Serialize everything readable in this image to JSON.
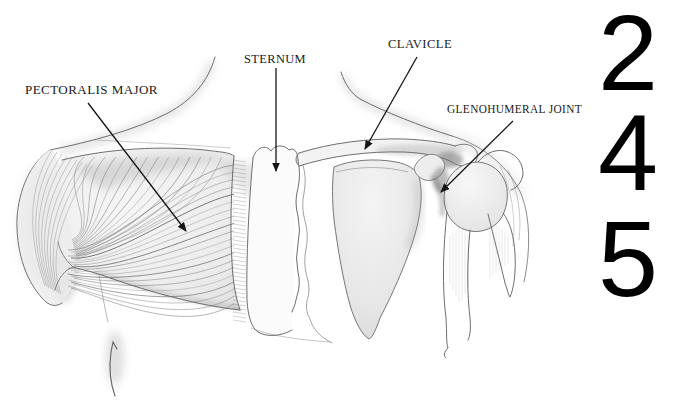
{
  "figure": {
    "type": "anatomical-diagram",
    "annotations": [
      {
        "text": "PECTORALIS MAJOR"
      },
      {
        "text": "STERNUM"
      },
      {
        "text": "CLAVICLE"
      },
      {
        "text": "GLENOHUMERAL JOINT"
      }
    ],
    "numbers": [
      "2",
      "4",
      "5"
    ],
    "colors": {
      "ink": "#1a1a1a",
      "sketch_gray": "#6e6e6e",
      "number_black": "#000000",
      "background": "#ffffff"
    }
  }
}
